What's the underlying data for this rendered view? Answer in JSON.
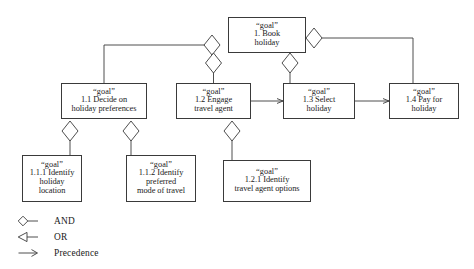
{
  "diagram": {
    "stroke_color": "#3a3a3a",
    "background_color": "#ffffff",
    "nodes": [
      {
        "id": "g1",
        "type_label": "“goal”",
        "label": "1. Book\nholiday",
        "x": 228,
        "y": 17,
        "w": 78,
        "h": 36
      },
      {
        "id": "g11",
        "type_label": "“goal”",
        "label": "1.1 Decide on\nholiday preferences",
        "x": 61,
        "y": 83,
        "w": 86,
        "h": 36
      },
      {
        "id": "g12",
        "type_label": "“goal”",
        "label": "1.2 Engage\ntravel agent",
        "x": 176,
        "y": 83,
        "w": 75,
        "h": 36
      },
      {
        "id": "g13",
        "type_label": "“goal”",
        "label": "1.3 Select\nholiday",
        "x": 283,
        "y": 83,
        "w": 72,
        "h": 36
      },
      {
        "id": "g14",
        "type_label": "“goal”",
        "label": "1.4 Pay for\nholiday",
        "x": 389,
        "y": 83,
        "w": 70,
        "h": 36
      },
      {
        "id": "g111",
        "type_label": "“goal”",
        "label": "1.1.1 Identify\nholiday\nlocation",
        "x": 22,
        "y": 155,
        "w": 60,
        "h": 47
      },
      {
        "id": "g112",
        "type_label": "“goal”",
        "label": "1.1.2 Identify\npreferred\nmode of travel",
        "x": 126,
        "y": 155,
        "w": 70,
        "h": 47
      },
      {
        "id": "g121",
        "type_label": "“goal”",
        "label": "1.2.1 Identify\ntravel agent options",
        "x": 223,
        "y": 160,
        "w": 88,
        "h": 42
      }
    ],
    "legend": {
      "items": [
        {
          "symbol": "and-diamond-icon",
          "label": "AND"
        },
        {
          "symbol": "or-triangle-icon",
          "label": "OR"
        },
        {
          "symbol": "precedence-arrow-icon",
          "label": "Precedence"
        }
      ]
    }
  }
}
